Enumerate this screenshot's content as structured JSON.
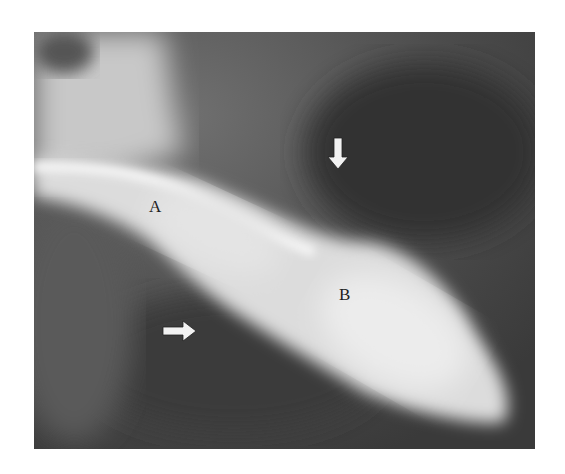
{
  "figure": {
    "type": "radiograph",
    "labels": {
      "a": "A",
      "b": "B"
    },
    "arrows": [
      {
        "direction": "down",
        "name": "arrow-down"
      },
      {
        "direction": "right",
        "name": "arrow-right"
      }
    ],
    "colors": {
      "background": "#4a4a4a",
      "bright_structure": "#e6e6e6",
      "arrow": "#f2f2f2"
    }
  }
}
